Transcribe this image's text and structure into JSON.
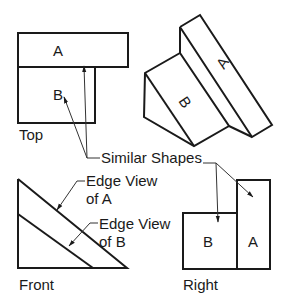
{
  "diagram": {
    "views": {
      "top": {
        "caption": "Top",
        "faces": [
          {
            "label": "A"
          },
          {
            "label": "B"
          }
        ]
      },
      "isometric": {
        "faces": [
          {
            "label": "A"
          },
          {
            "label": "B"
          }
        ]
      },
      "front": {
        "caption": "Front"
      },
      "right": {
        "caption": "Right",
        "faces": [
          {
            "label": "B"
          },
          {
            "label": "A"
          }
        ]
      }
    },
    "annotations": {
      "similar_shapes": "Similar Shapes",
      "edge_view_a_line1": "Edge View",
      "edge_view_a_line2": "of A",
      "edge_view_b_line1": "Edge View",
      "edge_view_b_line2": "of B"
    },
    "colors": {
      "line": "#1a1a1a",
      "background": "#ffffff"
    }
  }
}
